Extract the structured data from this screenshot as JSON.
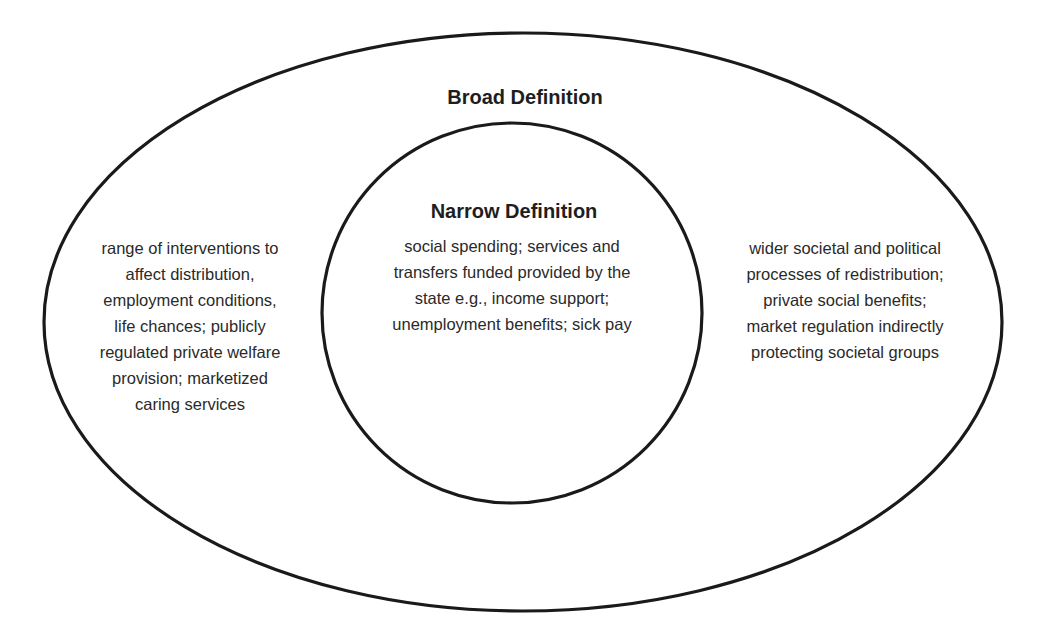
{
  "diagram": {
    "type": "nested-ellipses",
    "stroke_color": "#1a1a1a",
    "background_color": "#ffffff",
    "outer": {
      "title": "Broad Definition",
      "left_text_lines": [
        "range of interventions to",
        "affect distribution,",
        "employment conditions,",
        "life chances; publicly",
        "regulated private welfare",
        "provision; marketized",
        "caring services"
      ],
      "right_text_lines": [
        "wider societal and political",
        "processes of redistribution;",
        "private social benefits;",
        "market regulation indirectly",
        "protecting societal groups"
      ]
    },
    "inner": {
      "title": "Narrow Definition",
      "text_lines": [
        "social spending; services and",
        "transfers funded provided by the",
        "state e.g., income support;",
        "unemployment benefits; sick pay"
      ]
    }
  }
}
